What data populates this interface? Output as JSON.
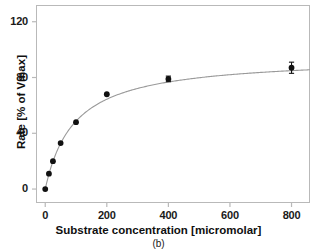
{
  "figure": {
    "caption": "(b)"
  },
  "chart_data": {
    "type": "scatter",
    "title": "",
    "xlabel": "Substrate concentration [micromolar]",
    "ylabel": "Rate [% of Vmax]",
    "xlim": [
      -30,
      860
    ],
    "ylim": [
      -10,
      132
    ],
    "xticks": [
      0,
      200,
      400,
      600,
      800
    ],
    "xtick_labels": [
      "0",
      "200",
      "400",
      "600",
      "800"
    ],
    "yticks": [
      0,
      40,
      80,
      120
    ],
    "ytick_labels": [
      "0",
      "40",
      "80",
      "120"
    ],
    "grid": false,
    "legend": null,
    "marker": "filled-circle",
    "marker_color": "#111111",
    "curve_color": "#9a9a9a",
    "frame_color": "#b9b9b9",
    "x": [
      0,
      12,
      25,
      50,
      100,
      200,
      400,
      800
    ],
    "y": [
      0,
      11,
      20,
      33,
      48,
      68,
      79,
      87
    ],
    "yerr": [
      0,
      0,
      0,
      0,
      0,
      0,
      2,
      4
    ],
    "fit": {
      "model": "michaelis-menten",
      "vmax": 95,
      "km": 95
    }
  }
}
